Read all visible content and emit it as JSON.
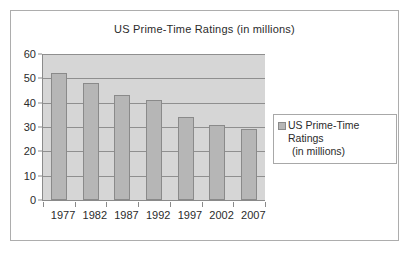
{
  "chart_data": {
    "type": "bar",
    "title": "US Prime-Time Ratings (in millions)",
    "categories": [
      "1977",
      "1982",
      "1987",
      "1992",
      "1997",
      "2002",
      "2007"
    ],
    "values": [
      52,
      48,
      43,
      41,
      34,
      31,
      29
    ],
    "series": [
      {
        "name": "US Prime-Time Ratings (in millions)",
        "values": [
          52,
          48,
          43,
          41,
          34,
          31,
          29
        ]
      }
    ],
    "xlabel": "",
    "ylabel": "",
    "ylim": [
      0,
      60
    ],
    "ytick_labels": [
      "60",
      "50",
      "40",
      "30",
      "20",
      "10",
      "0"
    ],
    "ytick_values": [
      60,
      50,
      40,
      30,
      20,
      10,
      0
    ],
    "grid": true,
    "legend_position": "right",
    "colors": {
      "bar_fill": "#b6b6b6",
      "bar_border": "#8a8a8a",
      "plot_background": "#d6d6d6",
      "gridline": "#8f8f8f",
      "frame_border": "#adadad",
      "text": "#2b2b2b"
    }
  },
  "legend": {
    "entries": [
      {
        "label_line1": "US Prime-Time Ratings",
        "label_line2": "(in millions)",
        "swatch": "bar-swatch"
      }
    ]
  }
}
